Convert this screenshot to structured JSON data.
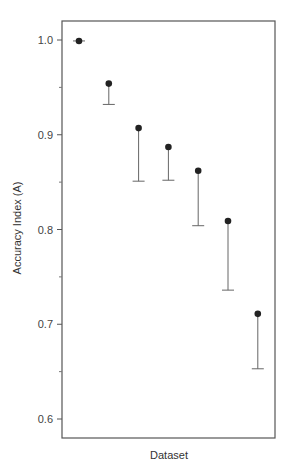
{
  "chart_data": {
    "type": "scatter",
    "title": "",
    "xlabel": "Dataset",
    "ylabel": "Accuracy Index (A)",
    "ylim": [
      0.58,
      1.02
    ],
    "yticks": [
      0.6,
      0.7,
      0.8,
      0.9,
      1.0
    ],
    "ytick_labels": [
      "0.6",
      "0.7",
      "0.8",
      "0.9",
      "1.0"
    ],
    "minor_yticks": [
      0.65,
      0.75,
      0.85,
      0.95
    ],
    "grid": false,
    "legend": null,
    "error_bars": "lower only (one-sided)",
    "x": [
      1,
      2,
      3,
      4,
      5,
      6,
      7
    ],
    "series": [
      {
        "name": "Accuracy Index",
        "values": [
          0.999,
          0.954,
          0.907,
          0.887,
          0.862,
          0.809,
          0.711
        ],
        "lower": [
          0.999,
          0.932,
          0.851,
          0.852,
          0.804,
          0.736,
          0.653
        ]
      }
    ]
  },
  "labels": {
    "xlabel": "Dataset",
    "ylabel": "Accuracy Index (A)"
  }
}
